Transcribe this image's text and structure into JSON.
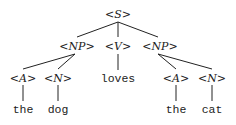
{
  "diagram": {
    "type": "parse-tree",
    "nodes": {
      "s": {
        "label": "<S>",
        "x": 118,
        "y": 18
      },
      "np1": {
        "label": "<NP>",
        "x": 77,
        "y": 50
      },
      "v": {
        "label": "<V>",
        "x": 118,
        "y": 50
      },
      "np2": {
        "label": "<NP>",
        "x": 160,
        "y": 50
      },
      "a1": {
        "label": "<A>",
        "x": 23,
        "y": 82
      },
      "n1": {
        "label": "<N>",
        "x": 58,
        "y": 82
      },
      "loves": {
        "label": "loves",
        "x": 118,
        "y": 82
      },
      "a2": {
        "label": "<A>",
        "x": 176,
        "y": 82
      },
      "n2": {
        "label": "<N>",
        "x": 212,
        "y": 82
      },
      "the1": {
        "label": "the",
        "x": 23,
        "y": 113
      },
      "dog": {
        "label": "dog",
        "x": 58,
        "y": 113
      },
      "the2": {
        "label": "the",
        "x": 176,
        "y": 113
      },
      "cat": {
        "label": "cat",
        "x": 212,
        "y": 113
      }
    },
    "edges": [
      [
        "s",
        "np1"
      ],
      [
        "s",
        "v"
      ],
      [
        "s",
        "np2"
      ],
      [
        "np1",
        "a1"
      ],
      [
        "np1",
        "n1"
      ],
      [
        "v",
        "loves"
      ],
      [
        "np2",
        "a2"
      ],
      [
        "np2",
        "n2"
      ],
      [
        "a1",
        "the1"
      ],
      [
        "n1",
        "dog"
      ],
      [
        "a2",
        "the2"
      ],
      [
        "n2",
        "cat"
      ]
    ],
    "sentence": "the dog loves the cat"
  }
}
